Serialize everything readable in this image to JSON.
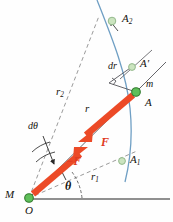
{
  "figure": {
    "colors": {
      "orbit_arc": "#6f9fc4",
      "force_arrow": "#ec4a27",
      "force_label": "#e03a22",
      "mass_dot_fill": "#5fbf5a",
      "mass_dot_stroke": "#2f7a2c",
      "ghost_dot_fill": "#bfe0b4",
      "ghost_dot_stroke": "#8fb98a",
      "baseline": "#6b6b6b",
      "thin_line": "#4a4a4a",
      "dashed_line": "#8a8a8a",
      "text": "#15130f"
    },
    "labels": [
      {
        "id": "A2",
        "text": "A",
        "sub": "2",
        "x": 122,
        "y": 14,
        "size": 11,
        "style": "italic",
        "color": "text"
      },
      {
        "id": "dr",
        "text": "dr",
        "sub": "",
        "x": 110,
        "y": 67,
        "size": 10,
        "style": "italic",
        "color": "text"
      },
      {
        "id": "Aprime",
        "text": "A'",
        "sub": "",
        "x": 141,
        "y": 64,
        "size": 11,
        "style": "italic",
        "color": "text"
      },
      {
        "id": "m",
        "text": "m",
        "sub": "",
        "x": 147,
        "y": 86,
        "size": 10,
        "style": "italic",
        "color": "text"
      },
      {
        "id": "A",
        "text": "A",
        "sub": "",
        "x": 146,
        "y": 104,
        "size": 11,
        "style": "italic",
        "color": "text"
      },
      {
        "id": "r2",
        "text": "r",
        "sub": "2",
        "x": 56,
        "y": 90,
        "size": 11,
        "style": "italic",
        "color": "text"
      },
      {
        "id": "r",
        "text": "r",
        "sub": "",
        "x": 85,
        "y": 105,
        "size": 11,
        "style": "italic",
        "color": "text"
      },
      {
        "id": "dtheta",
        "text": "dθ",
        "sub": "",
        "x": 30,
        "y": 126,
        "size": 10,
        "style": "italic",
        "color": "text"
      },
      {
        "id": "F",
        "text": "F",
        "sub": "",
        "x": 102,
        "y": 142,
        "size": 11,
        "style": "bold-italic",
        "color": "force_label"
      },
      {
        "id": "negF",
        "text": "−F",
        "sub": "",
        "x": 68,
        "y": 161,
        "size": 11,
        "style": "bold-italic",
        "color": "force_label"
      },
      {
        "id": "A1",
        "text": "A",
        "sub": "1",
        "x": 131,
        "y": 160,
        "size": 11,
        "style": "italic",
        "color": "text"
      },
      {
        "id": "r1",
        "text": "r",
        "sub": "1",
        "x": 92,
        "y": 176,
        "size": 11,
        "style": "italic",
        "color": "text"
      },
      {
        "id": "theta",
        "text": "θ",
        "sub": "",
        "x": 66,
        "y": 186,
        "size": 11,
        "style": "bold-italic",
        "color": "text"
      },
      {
        "id": "M",
        "text": "M",
        "sub": "",
        "x": 6,
        "y": 190,
        "size": 11,
        "style": "italic",
        "color": "text"
      },
      {
        "id": "O",
        "text": "O",
        "sub": "",
        "x": 25,
        "y": 207,
        "size": 11,
        "style": "italic",
        "color": "text"
      }
    ],
    "points": {
      "origin": {
        "name": "O",
        "x": 29,
        "y": 198,
        "r": 4.2,
        "kind": "mass"
      },
      "A": {
        "name": "A",
        "x": 136,
        "y": 92,
        "r": 4.2,
        "kind": "mass"
      },
      "Aprime": {
        "name": "A'",
        "x": 132,
        "y": 67,
        "r": 3.6,
        "kind": "ghost"
      },
      "A1": {
        "name": "A1",
        "x": 122,
        "y": 161,
        "r": 3.6,
        "kind": "ghost"
      },
      "A2": {
        "name": "A2",
        "x": 112,
        "y": 21,
        "r": 3.8,
        "kind": "ghost"
      }
    },
    "geometry": {
      "baseline": {
        "x1": 27,
        "y1": 199,
        "x2": 170,
        "y2": 199
      },
      "orbit_arc": "M 97,0 C 112,38 126,72 130,108 C 133,138 130,162 125,182",
      "radius_r": {
        "x1": 29,
        "y1": 198,
        "x2": 136,
        "y2": 92
      },
      "radius_r_ext": {
        "x1": 136,
        "y1": 92,
        "x2": 163,
        "y2": 65
      },
      "radius_r1_dash": {
        "x1": 29,
        "y1": 198,
        "x2": 135,
        "y2": 152
      },
      "radius_r2_dash": {
        "x1": 29,
        "y1": 198,
        "x2": 98,
        "y2": 20
      },
      "perp_line": {
        "x1": 110,
        "y1": 84,
        "x2": 132,
        "y2": 67
      },
      "perp_drop": {
        "x1": 110,
        "y1": 84,
        "x2": 136,
        "y2": 92
      },
      "dtheta_leader": {
        "x1": 44,
        "y1": 134,
        "x2": 56,
        "y2": 166
      },
      "dtheta_arc": "M 34,156 A 36,36 0 0 1 56,148",
      "theta_arc": "M 78,197 A 50,50 0 0 0 69,175",
      "arc_A2_leader": {
        "x1": 118,
        "y1": 30,
        "x2": 110,
        "y2": 20
      }
    },
    "arrows": {
      "F": {
        "from": {
          "x": 134,
          "y": 95
        },
        "to": {
          "x": 80,
          "y": 141
        },
        "width": 6.5,
        "label": "F"
      },
      "negF": {
        "from": {
          "x": 33,
          "y": 194
        },
        "to": {
          "x": 86,
          "y": 149
        },
        "width": 6.5,
        "label": "−F"
      }
    }
  }
}
